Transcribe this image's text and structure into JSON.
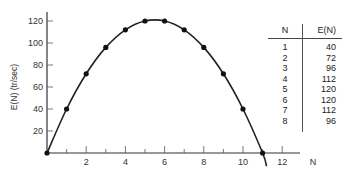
{
  "chart_data": {
    "type": "line",
    "title": "",
    "xlabel": "N",
    "ylabel": "E(N) (tr/sec)",
    "x": [
      0,
      1,
      2,
      3,
      4,
      5,
      6,
      7,
      8,
      9,
      10,
      11
    ],
    "series": [
      {
        "name": "E(N)",
        "values": [
          0,
          40,
          72,
          96,
          112,
          120,
          120,
          112,
          96,
          72,
          40,
          0
        ]
      }
    ],
    "xlim": [
      0,
      13
    ],
    "ylim": [
      0,
      130
    ],
    "x_ticks": [
      "2",
      "4",
      "6",
      "8",
      "10",
      "12"
    ],
    "y_ticks": [
      "20",
      "40",
      "60",
      "80",
      "100",
      "120"
    ],
    "grid": false,
    "markers": true
  },
  "axis": {
    "ylabel": "E(N)  (tr/sec)",
    "xlabel": "N"
  },
  "table": {
    "headers": [
      "N",
      "E(N)"
    ],
    "rows": [
      [
        "1",
        "40"
      ],
      [
        "2",
        "72"
      ],
      [
        "3",
        "96"
      ],
      [
        "4",
        "112"
      ],
      [
        "5",
        "120"
      ],
      [
        "6",
        "120"
      ],
      [
        "7",
        "112"
      ],
      [
        "8",
        "96"
      ]
    ]
  }
}
